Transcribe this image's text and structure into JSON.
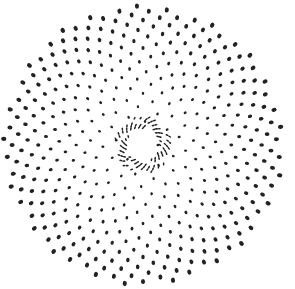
{
  "figure": {
    "description": "Phyllotaxis dot spiral pattern",
    "background": "#ffffff",
    "dot_color": "#222222",
    "center": [
      143,
      145
    ],
    "hole_radius": 15,
    "outer_radius": 140,
    "dot_count": 420,
    "divergence_angle_deg": 137.5,
    "dot_radius_outer": 2.3,
    "dot_radius_inner": 1.3
  }
}
